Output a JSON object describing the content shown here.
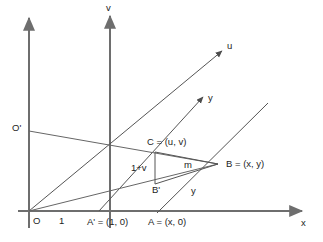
{
  "figure": {
    "type": "geometric-diagram",
    "background_color": "#ffffff",
    "axis_color": "#6e6e6e",
    "line_color": "#555555",
    "text_color": "#1d1d1d"
  },
  "axes": [
    {
      "id": "x-axis",
      "label": "x",
      "direction": "horizontal-right",
      "arrow": true
    },
    {
      "id": "v-axis",
      "label": "v",
      "direction": "vertical-up",
      "arrow": true
    },
    {
      "id": "left-vertical-axis",
      "label": "",
      "direction": "vertical-up",
      "arrow": true
    }
  ],
  "rays": [
    {
      "id": "u-ray",
      "label": "u",
      "arrow": true
    },
    {
      "id": "y-ray",
      "label": "y",
      "arrow": true
    },
    {
      "id": "b-diagonal-ray",
      "label": "",
      "arrow": false
    }
  ],
  "points": [
    {
      "id": "O",
      "label": "O",
      "x": 29,
      "y": 211
    },
    {
      "id": "one",
      "label": "1",
      "x": 62,
      "y": 211
    },
    {
      "id": "Aprime",
      "label": "A' = (1, 0)",
      "x": 110,
      "y": 211
    },
    {
      "id": "A",
      "label": "A = (x, 0)",
      "x": 173,
      "y": 211
    },
    {
      "id": "Oprime",
      "label": "O'",
      "x": 29,
      "y": 131
    },
    {
      "id": "C",
      "label": "C = (u, v)",
      "x": 155,
      "y": 152
    },
    {
      "id": "Bprime",
      "label": "B'",
      "x": 155,
      "y": 184
    },
    {
      "id": "B",
      "label": "B = (x, y)",
      "x": 218,
      "y": 164
    }
  ],
  "segment_labels": [
    {
      "id": "one-plus-v",
      "label": "1+v",
      "note": "vertical segment from B' up to C"
    },
    {
      "id": "m-label",
      "label": "m",
      "note": "inside triangle C-B'-B"
    },
    {
      "id": "y-label",
      "label": "y",
      "note": "along lower diagonal near B"
    }
  ],
  "labels": {
    "x_axis": "x",
    "v_axis": "v",
    "u_ray": "u",
    "y_ray": "y",
    "origin": "O",
    "unit": "1",
    "o_prime": "O'",
    "c_point": "C = (u, v)",
    "b_prime": "B'",
    "b_point": "B = (x, y)",
    "a_prime": "A' = (1, 0)",
    "a_point": "A = (x, 0)",
    "one_plus_v": "1+v",
    "m": "m",
    "y_segment": "y"
  }
}
